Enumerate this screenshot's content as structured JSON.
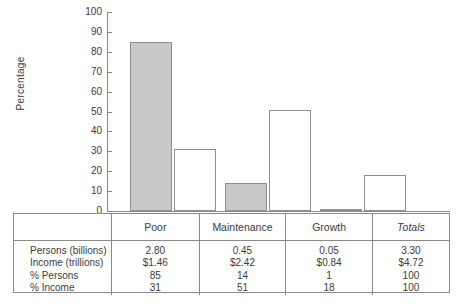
{
  "chart_data": {
    "type": "bar",
    "title": "",
    "xlabel": "",
    "ylabel": "Percentage",
    "ylim": [
      0,
      100
    ],
    "ytick_step": 10,
    "yticks": [
      0,
      10,
      20,
      30,
      40,
      50,
      60,
      70,
      80,
      90,
      100
    ],
    "grid": false,
    "legend": "none",
    "categories": [
      "Poor",
      "Maintenance",
      "Growth"
    ],
    "series": [
      {
        "name": "% Persons",
        "values": [
          85,
          14,
          1
        ],
        "color": "#c9c9c9"
      },
      {
        "name": "% Income",
        "values": [
          31,
          51,
          18
        ],
        "color": "#ffffff"
      }
    ]
  },
  "axis": {
    "ylabel": "Percentage",
    "ticks": [
      "100",
      "90",
      "80",
      "70",
      "60",
      "50",
      "40",
      "30",
      "20",
      "10",
      "0"
    ]
  },
  "table": {
    "columns": [
      "",
      "Poor",
      "Maintenance",
      "Growth",
      "Totals"
    ],
    "totals_header_italic": true,
    "rows": [
      {
        "label": "Persons (billions)",
        "values": [
          "2.80",
          "0.45",
          "0.05",
          "3.30"
        ]
      },
      {
        "label": "Income (trillions)",
        "values": [
          "$1.46",
          "$2.42",
          "$0.84",
          "$4.72"
        ]
      },
      {
        "label": "% Persons",
        "values": [
          "85",
          "14",
          "1",
          "100"
        ]
      },
      {
        "label": "% Income",
        "values": [
          "31",
          "51",
          "18",
          "100"
        ]
      }
    ]
  },
  "colors": {
    "bar_fill_persons": "#c9c9c9",
    "bar_fill_income": "#ffffff",
    "stroke": "#8a8a8a",
    "text": "#3c3c3c"
  }
}
